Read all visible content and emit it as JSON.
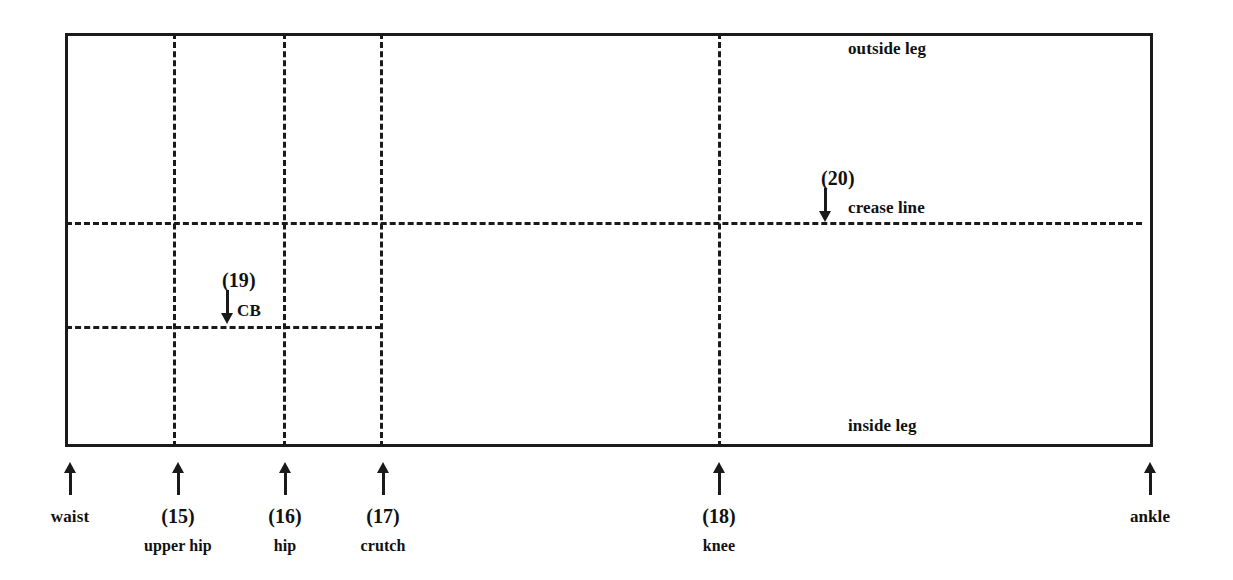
{
  "diagram": {
    "colors": {
      "line": "#1a1a1a",
      "background": "#ffffff"
    },
    "frame": {
      "name": "trouser-block-rectangle",
      "left": 65,
      "top": 33,
      "width": 1088,
      "height": 414
    },
    "inner_labels": [
      {
        "id": "outside-leg",
        "text": "outside leg",
        "x": 848,
        "y": 40
      },
      {
        "id": "inside-leg",
        "text": "inside leg",
        "x": 848,
        "y": 417
      },
      {
        "id": "crease-line",
        "text": "crease line",
        "x": 848,
        "y": 199
      },
      {
        "id": "cb",
        "text": "CB",
        "x": 237,
        "y": 302
      }
    ],
    "callouts": [
      {
        "id": "callout-19",
        "number": "(19)",
        "label": "CB",
        "number_x": 222,
        "number_y": 270,
        "arrow_x": 227,
        "arrow_top": 290,
        "arrow_height": 34
      },
      {
        "id": "callout-20",
        "number": "(20)",
        "label": "crease line",
        "number_x": 821,
        "number_y": 168,
        "arrow_x": 825,
        "arrow_top": 188,
        "arrow_height": 34
      }
    ],
    "vertical_lines": [
      {
        "id": "upper-hip-line",
        "x": 173,
        "top": 33,
        "bottom": 447
      },
      {
        "id": "hip-line",
        "x": 283,
        "top": 33,
        "bottom": 447
      },
      {
        "id": "crutch-line",
        "x": 380,
        "top": 33,
        "bottom": 447
      },
      {
        "id": "knee-line",
        "x": 718,
        "top": 33,
        "bottom": 447
      }
    ],
    "horizontal_lines": [
      {
        "id": "crease-line-h",
        "y": 222,
        "left": 66,
        "right": 1142
      },
      {
        "id": "cb-line-h",
        "y": 326,
        "left": 66,
        "right": 381
      }
    ],
    "bottom_markers": [
      {
        "id": "waist",
        "x": 70,
        "number": "",
        "name": "waist"
      },
      {
        "id": "upper-hip",
        "x": 178,
        "number": "(15)",
        "name": "upper hip"
      },
      {
        "id": "hip",
        "x": 285,
        "number": "(16)",
        "name": "hip"
      },
      {
        "id": "crutch",
        "x": 383,
        "number": "(17)",
        "name": "crutch"
      },
      {
        "id": "knee",
        "x": 719,
        "number": "(18)",
        "name": "knee"
      },
      {
        "id": "ankle",
        "x": 1150,
        "number": "",
        "name": "ankle"
      }
    ]
  }
}
